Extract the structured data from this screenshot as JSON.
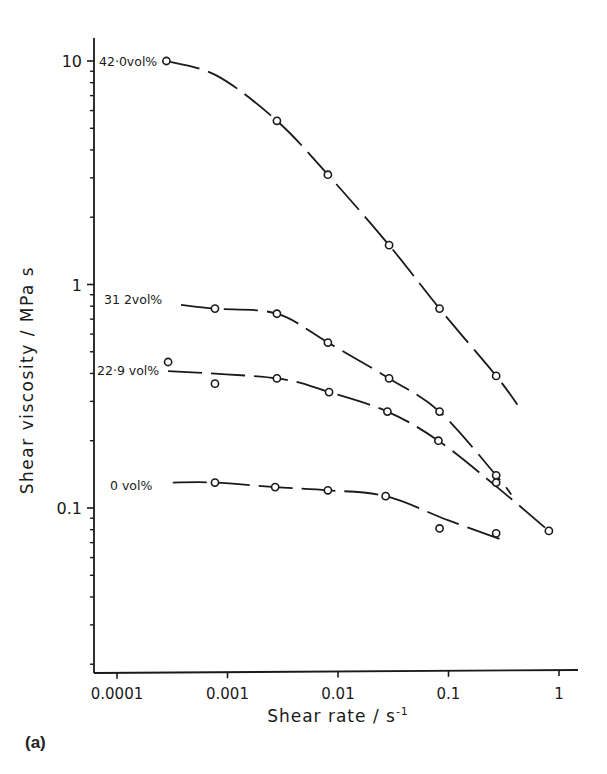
{
  "chart_data": {
    "type": "line",
    "title": "",
    "panel_label": "(a)",
    "xlabel": "Shear rate   / s",
    "xlabel_sup": "-1",
    "ylabel": "Shear viscosity   / MPa s",
    "xscale": "log",
    "yscale": "log",
    "xlim": [
      5e-05,
      1.3
    ],
    "ylim": [
      0.018,
      11
    ],
    "x_ticks": [
      0.0001,
      0.001,
      0.01,
      0.1,
      1
    ],
    "x_tick_labels": [
      "0.0001",
      "0.001",
      "0.01",
      "0.1",
      "1"
    ],
    "y_ticks": [
      0.1,
      1,
      10
    ],
    "y_tick_labels": [
      "0.1",
      "1",
      "10"
    ],
    "grid": false,
    "legend": "inline labels at left of each curve",
    "series": [
      {
        "name": "42.0 vol%",
        "label": "42·0vol%",
        "points": [
          [
            0.00028,
            10.0
          ],
          [
            0.0028,
            5.4
          ],
          [
            0.0081,
            3.1
          ],
          [
            0.029,
            1.5
          ],
          [
            0.083,
            0.78
          ],
          [
            0.27,
            0.39
          ]
        ],
        "curve": [
          [
            0.00028,
            10.0
          ],
          [
            0.0008,
            8.6
          ],
          [
            0.0028,
            5.4
          ],
          [
            0.0081,
            3.1
          ],
          [
            0.029,
            1.5
          ],
          [
            0.083,
            0.78
          ],
          [
            0.27,
            0.39
          ],
          [
            0.42,
            0.29
          ]
        ]
      },
      {
        "name": "31.2 vol%",
        "label": "31 2vol%",
        "points": [
          [
            0.00077,
            0.78
          ],
          [
            0.0028,
            0.74
          ],
          [
            0.0081,
            0.55
          ],
          [
            0.029,
            0.38
          ],
          [
            0.083,
            0.27
          ],
          [
            0.27,
            0.14
          ]
        ],
        "curve": [
          [
            0.00038,
            0.81
          ],
          [
            0.00077,
            0.78
          ],
          [
            0.0028,
            0.74
          ],
          [
            0.0081,
            0.55
          ],
          [
            0.029,
            0.38
          ],
          [
            0.083,
            0.27
          ],
          [
            0.27,
            0.14
          ],
          [
            0.37,
            0.115
          ]
        ]
      },
      {
        "name": "22.9 vol%",
        "label": "22·9 vol%",
        "points": [
          [
            0.00029,
            0.45
          ],
          [
            0.00077,
            0.36
          ],
          [
            0.0028,
            0.38
          ],
          [
            0.0083,
            0.33
          ],
          [
            0.028,
            0.27
          ],
          [
            0.081,
            0.2
          ],
          [
            0.27,
            0.13
          ],
          [
            0.81,
            0.079
          ]
        ],
        "curve": [
          [
            0.00029,
            0.41
          ],
          [
            0.0028,
            0.38
          ],
          [
            0.0083,
            0.33
          ],
          [
            0.028,
            0.27
          ],
          [
            0.081,
            0.2
          ],
          [
            0.27,
            0.125
          ],
          [
            0.81,
            0.079
          ]
        ]
      },
      {
        "name": "0 vol%",
        "label": "0 vol%",
        "points": [
          [
            0.00077,
            0.13
          ],
          [
            0.0027,
            0.124
          ],
          [
            0.0081,
            0.12
          ],
          [
            0.027,
            0.113
          ],
          [
            0.083,
            0.081
          ],
          [
            0.27,
            0.077
          ]
        ],
        "curve": [
          [
            0.00032,
            0.13
          ],
          [
            0.00077,
            0.13
          ],
          [
            0.0027,
            0.124
          ],
          [
            0.0081,
            0.12
          ],
          [
            0.027,
            0.113
          ],
          [
            0.1,
            0.088
          ],
          [
            0.33,
            0.071
          ]
        ]
      }
    ]
  }
}
